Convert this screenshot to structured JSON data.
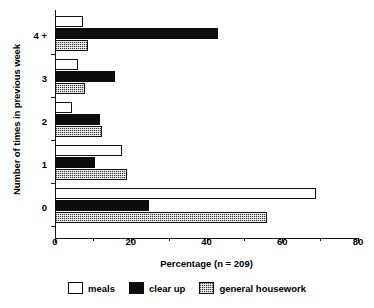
{
  "chart_data": {
    "type": "bar",
    "orientation": "horizontal",
    "title": "",
    "xlabel": "Percentage (n = 209)",
    "ylabel": "Number of times in previous week",
    "categories": [
      "4 +",
      "3",
      "2",
      "1",
      "0"
    ],
    "series": [
      {
        "name": "meals",
        "values": [
          7.4,
          6.0,
          4.5,
          17.7,
          68.9
        ]
      },
      {
        "name": "clear up",
        "values": [
          43.0,
          15.8,
          12.0,
          10.5,
          24.7
        ]
      },
      {
        "name": "general housework",
        "values": [
          8.7,
          7.9,
          12.4,
          19.0,
          56.0
        ]
      }
    ],
    "xlim": [
      0,
      80
    ],
    "xticks": [
      0,
      20,
      40,
      60,
      80
    ],
    "xminorticks": [
      10,
      30,
      50,
      70
    ],
    "xticklabels": [
      "0",
      "20",
      "40",
      "60",
      "80"
    ],
    "grid": false,
    "legend_position": "bottom",
    "colors": {
      "meals": "#ffffff",
      "clear_up": "#0c0c0c",
      "general_housework": "#8d8d8d",
      "axis": "#1a1a1a",
      "text": "#000000",
      "background": "#ffffff"
    }
  },
  "legend": {
    "items": [
      {
        "label": "meals"
      },
      {
        "label": "clear up"
      },
      {
        "label": "general housework"
      }
    ]
  }
}
